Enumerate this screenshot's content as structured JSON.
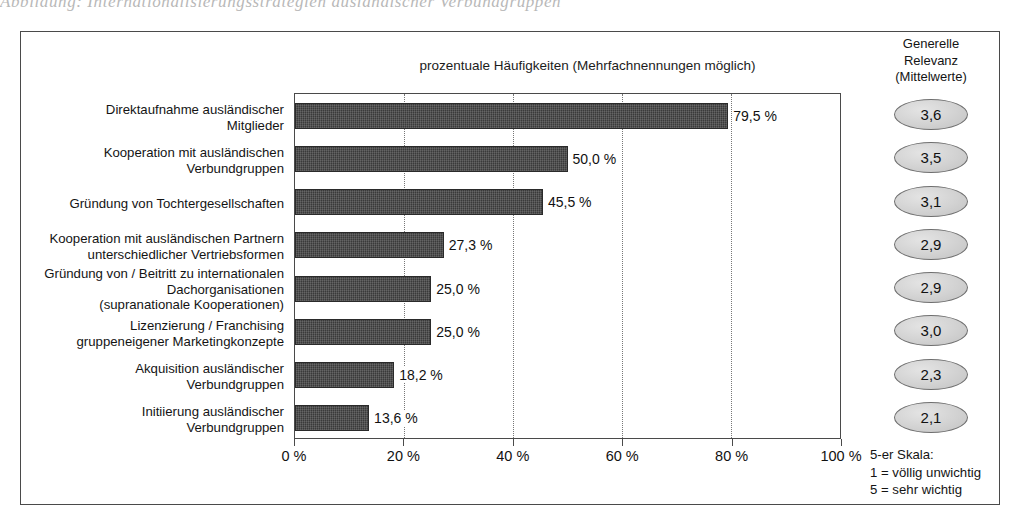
{
  "page_bleed_text": "Abbildung: Internationalisierungsstrategien ausländischer Verbundgruppen",
  "chart_data": {
    "type": "bar",
    "orientation": "horizontal",
    "title": "prozentuale Häufigkeiten (Mehrfachnennungen möglich)",
    "xlabel": "",
    "ylabel": "",
    "xlim": [
      0,
      100
    ],
    "grid": true,
    "gridlines_at": [
      20,
      40,
      60,
      80
    ],
    "xticks": [
      0,
      20,
      40,
      60,
      80,
      100
    ],
    "xtick_labels": [
      "0 %",
      "20 %",
      "40 %",
      "60 %",
      "80 %",
      "100 %"
    ],
    "categories": [
      "Direktaufnahme ausländischer\nMitglieder",
      "Kooperation mit ausländischen\nVerbundgruppen",
      "Gründung von Tochtergesellschaften",
      "Kooperation mit ausländischen Partnern\nunterschiedlicher Vertriebsformen",
      "Gründung von / Beitritt zu internationalen\nDachorganisationen\n(supranationale Kooperationen)",
      "Lizenzierung / Franchising\ngruppeneigener Marketingkonzepte",
      "Akquisition ausländischer\nVerbundgruppen",
      "Initiierung ausländischer\nVerbundgruppen"
    ],
    "values": [
      79.5,
      50.0,
      45.5,
      27.3,
      25.0,
      25.0,
      18.2,
      13.6
    ],
    "value_labels": [
      "79,5 %",
      "50,0 %",
      "45,5 %",
      "27,3 %",
      "25,0 %",
      "25,0 %",
      "18,2 %",
      "13,6 %"
    ],
    "bar_color": "#3a3a3a",
    "secondary_series": {
      "name": "Generelle Relevanz (Mittelwerte)",
      "values": [
        3.6,
        3.5,
        3.1,
        2.9,
        2.9,
        3.0,
        2.3,
        2.1
      ],
      "value_labels": [
        "3,6",
        "3,5",
        "3,1",
        "2,9",
        "2,9",
        "3,0",
        "2,3",
        "2,1"
      ]
    }
  },
  "relevance_header": {
    "line1": "Generelle",
    "line2": "Relevanz",
    "line3": "(Mittelwerte)"
  },
  "scale_legend": {
    "line1": "5-er Skala:",
    "line2": "1 = völlig unwichtig",
    "line3": "5 = sehr wichtig"
  }
}
